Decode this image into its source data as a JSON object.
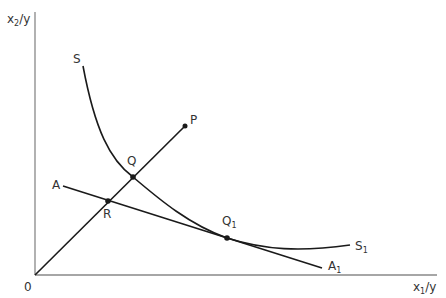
{
  "diagram": {
    "title_cutoff": "",
    "axes": {
      "origin_label": "0",
      "y_axis_label": "x",
      "y_axis_sub": "2",
      "y_axis_suffix": "/y",
      "x_axis_label": "x",
      "x_axis_sub": "1",
      "x_axis_suffix": "/y"
    },
    "curve": {
      "start_label": "S",
      "end_label": "S",
      "end_sub": "1"
    },
    "ray": {
      "end_label": "P"
    },
    "line": {
      "start_label": "A",
      "end_label": "A",
      "end_sub": "1"
    },
    "points": [
      {
        "label": "Q",
        "sub": ""
      },
      {
        "label": "R",
        "sub": ""
      },
      {
        "label": "Q",
        "sub": "1"
      }
    ],
    "colors": {
      "line": "#1a1a1a",
      "axis": "#888888",
      "text": "#333333"
    }
  }
}
